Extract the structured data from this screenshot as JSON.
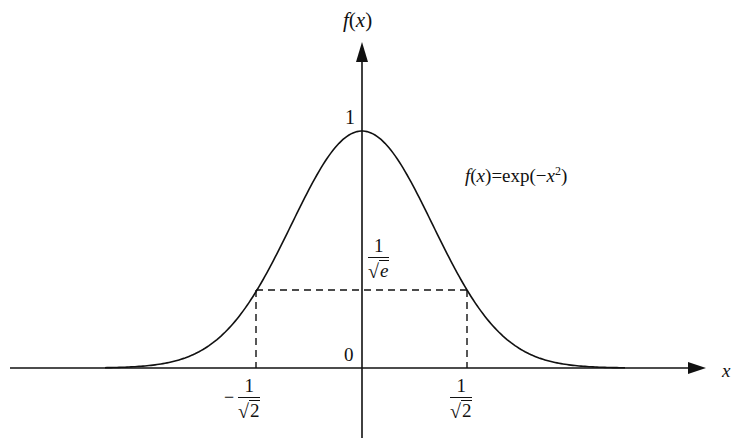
{
  "diagram": {
    "y_axis_label": {
      "func": "f",
      "open": "(",
      "var": "x",
      "close": ")"
    },
    "x_axis_label": "x",
    "origin_label": "0",
    "peak_label": "1",
    "formula": {
      "lhs_func": "f",
      "lhs_open": "(",
      "lhs_var": "x",
      "lhs_close": ")",
      "eq": "=exp(",
      "minus": "−",
      "var": "x",
      "exp": "2",
      "close": ")"
    },
    "level_label": {
      "numerator": "1",
      "sqrt_symbol": "√",
      "radicand": "e"
    },
    "left_tick_label": {
      "sign": "−",
      "numerator": "1",
      "sqrt_symbol": "√",
      "radicand": "2"
    },
    "right_tick_label": {
      "numerator": "1",
      "sqrt_symbol": "√",
      "radicand": "2"
    },
    "colors": {
      "stroke": "#111111",
      "background": "#ffffff"
    }
  }
}
